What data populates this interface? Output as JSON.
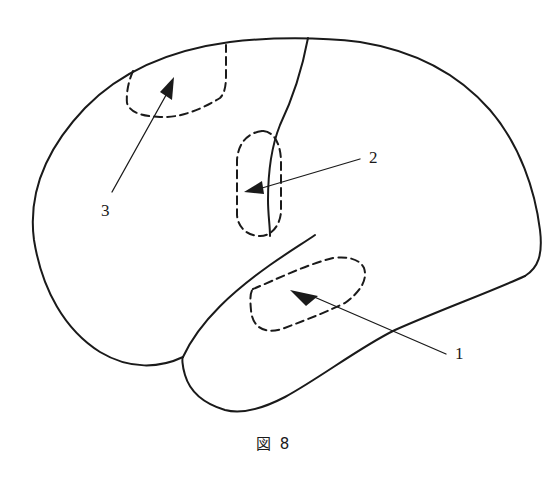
{
  "figure": {
    "caption": "図 8",
    "labels": [
      {
        "id": "1",
        "text": "1",
        "x": 455,
        "y": 344
      },
      {
        "id": "2",
        "text": "2",
        "x": 369,
        "y": 150
      },
      {
        "id": "3",
        "text": "3",
        "x": 101,
        "y": 201
      }
    ],
    "colors": {
      "stroke": "#1a1a1a",
      "background": "#ffffff"
    }
  }
}
